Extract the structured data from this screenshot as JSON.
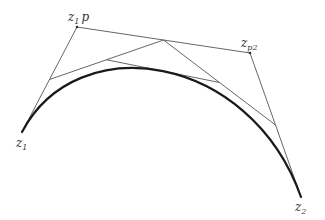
{
  "diagram": {
    "type": "bezier-de-casteljau-construction",
    "colors": {
      "background": "#ffffff",
      "construction_lines": "#555555",
      "curve": "#1a1a1a",
      "labels": "#333333"
    },
    "points": {
      "z1": {
        "x": 22,
        "y": 132
      },
      "z1p": {
        "x": 77,
        "y": 27
      },
      "zp2": {
        "x": 250,
        "y": 53
      },
      "z2": {
        "x": 301,
        "y": 197
      }
    },
    "labels": {
      "z1": {
        "base": "z",
        "sub": "1"
      },
      "z1p": {
        "base": "z",
        "sub": "1",
        "tail": "p"
      },
      "zp2": {
        "base": "z",
        "sub": "p2"
      },
      "z2": {
        "base": "z",
        "sub": "2"
      }
    }
  }
}
